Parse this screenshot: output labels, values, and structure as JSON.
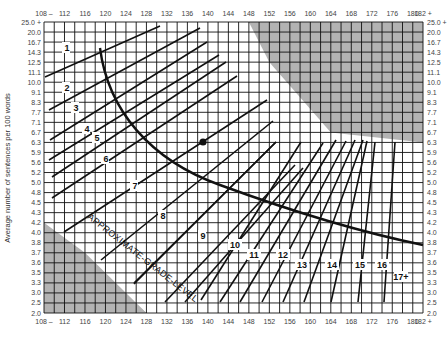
{
  "chart_data": {
    "type": "line",
    "xlabel": "Average number of syllables per 100 words",
    "ylabel": "Average number of sentences per 100 words",
    "x_ticks": [
      "108 –",
      "112",
      "116",
      "120",
      "124",
      "128",
      "132",
      "136",
      "140",
      "144",
      "148",
      "152",
      "156",
      "160",
      "164",
      "168",
      "172",
      "176",
      "180",
      "182 +"
    ],
    "y_ticks": [
      "25.0 +",
      "20.0",
      "16.7",
      "14.3",
      "12.5",
      "11.1",
      "10.0",
      "9.1",
      "8.3",
      "7.7",
      "7.1",
      "6.7",
      "6.3",
      "5.9",
      "5.6",
      "5.2",
      "5.0",
      "4.8",
      "4.5",
      "4.3",
      "4.2",
      "4.0",
      "3.8",
      "3.7",
      "3.6",
      "3.5",
      "3.3",
      "3.0",
      "2.5",
      "2.0"
    ],
    "xlim": [
      108,
      182
    ],
    "grid": true,
    "grade_labels": [
      "1",
      "2",
      "3",
      "4",
      "5",
      "6",
      "7",
      "8",
      "9",
      "10",
      "11",
      "12",
      "13",
      "14",
      "15",
      "16",
      "17+"
    ],
    "curve_annotation": "APPROXIMATE GRADE LEVEL",
    "invalid_regions": [
      "upper-right shaded",
      "lower-left shaded"
    ],
    "plotted_point": {
      "syllables": 141,
      "sentences": 6.3
    }
  },
  "axis": {
    "ylabel": "Average number of sentences per 100 words"
  }
}
